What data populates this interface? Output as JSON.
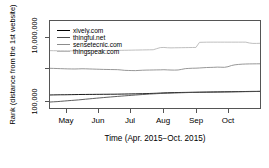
{
  "chart_data": {
    "type": "line",
    "title": "",
    "xlabel": "Time (Apr. 2015−Oct. 2015)",
    "ylabel": "Rank (distance from the 1st website)",
    "xtick_labels": [
      "May",
      "Jun",
      "Jul",
      "Aug",
      "Sep",
      "Oct"
    ],
    "ytick_labels": [
      "10,000,000",
      "100,000"
    ],
    "yscale": "log",
    "ylim": [
      100000,
      30000000
    ],
    "grid": false,
    "legend_position": "top-left",
    "legend_entries": [
      "xively.com",
      "thingful.net",
      "sensetecnic.com",
      "thingspeak.com"
    ],
    "colors": {
      "xively": "#000000",
      "thingful": "#4d4d4d",
      "sensetecnic": "#8c8c8c",
      "thingspeak": "#b8b8b8",
      "axis": "#555555"
    },
    "series": [
      {
        "name": "xively.com",
        "color": "#000000",
        "values": [
          235000,
          236000,
          237000,
          238000,
          238000,
          239000,
          240000,
          241000,
          242000,
          243000,
          243000,
          244000,
          244000,
          245000,
          245000,
          246000,
          246000,
          247000,
          247000,
          248000,
          249000,
          250000,
          251000,
          252000,
          253000,
          254000,
          255000,
          257000,
          259000,
          261000,
          263000,
          266000,
          269000,
          271000,
          273000,
          275000,
          276000,
          277000,
          278000,
          279000,
          280000,
          281000,
          282000,
          283000,
          284000,
          285000,
          286000,
          287000,
          288000,
          289000,
          290000,
          291000,
          292000,
          293000,
          294000,
          295000,
          296000,
          297000,
          297000,
          298000
        ]
      },
      {
        "name": "thingful.net",
        "color": "#4d4d4d",
        "values": [
          148000,
          150000,
          152000,
          155000,
          158000,
          161000,
          164000,
          167000,
          170000,
          174000,
          178000,
          182000,
          186000,
          190000,
          194000,
          198000,
          202000,
          206000,
          210000,
          214000,
          218000,
          222000,
          226000,
          230000,
          234000,
          238000,
          242000,
          246000,
          250000,
          253000,
          256000,
          259000,
          262000,
          264000,
          266000,
          268000,
          270000,
          272000,
          274000,
          276000,
          277000,
          278000,
          279000,
          280000,
          281000,
          282000,
          283000,
          284000,
          285000,
          286000,
          287000,
          288000,
          289000,
          290000,
          291000,
          292000,
          293000,
          294000,
          295000,
          296000
        ]
      },
      {
        "name": "sensetecnic.com",
        "color": "#8c8c8c",
        "values": [
          1350000,
          1340000,
          1330000,
          1320000,
          1310000,
          1300000,
          1295000,
          1290000,
          1300000,
          1310000,
          1305000,
          1295000,
          1285000,
          1275000,
          1265000,
          1255000,
          1250000,
          1245000,
          1240000,
          1235000,
          1210000,
          1180000,
          1170000,
          1165000,
          1160000,
          1175000,
          1190000,
          1200000,
          1205000,
          1210000,
          1215000,
          1220000,
          1230000,
          1215000,
          1205000,
          1200000,
          1210000,
          1260000,
          1320000,
          1340000,
          1355000,
          1360000,
          1380000,
          1400000,
          1420000,
          1430000,
          1440000,
          1460000,
          1450000,
          1440000,
          1500000,
          1620000,
          1700000,
          1740000,
          1770000,
          1790000,
          1800000,
          1805000,
          1810000,
          1815000
        ]
      },
      {
        "name": "thingspeak.com",
        "color": "#b8b8b8",
        "values": [
          4300000,
          4280000,
          4260000,
          4250000,
          4240000,
          4230000,
          4240000,
          4250000,
          4260000,
          4270000,
          4280000,
          4290000,
          4300000,
          4310000,
          4320000,
          4330000,
          4340000,
          4350000,
          4360000,
          4370000,
          4380000,
          4400000,
          4420000,
          4440000,
          4460000,
          4480000,
          4500000,
          4520000,
          4540000,
          4560000,
          4900000,
          5250000,
          5300000,
          5200000,
          5150000,
          5180000,
          5200000,
          5220000,
          5240000,
          5260000,
          5280000,
          5300000,
          7400000,
          7450000,
          7480000,
          7500000,
          7500000,
          7500000,
          7500000,
          7500000,
          7500000,
          7500000,
          7500000,
          7500000,
          7500000,
          7500000,
          7100000,
          6900000,
          6900000,
          6950000
        ]
      }
    ]
  }
}
